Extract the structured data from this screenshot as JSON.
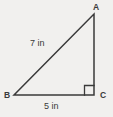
{
  "figure": {
    "type": "right-triangle-diagram",
    "vertices": {
      "a": "A",
      "b": "B",
      "c": "C"
    },
    "side_labels": {
      "hypotenuse_ab": "7 in",
      "base_bc": "5 in"
    },
    "right_angle_at": "C",
    "colors": {
      "line": "#3a3a3a",
      "text": "#3a3a3a",
      "background": "#f1f0ee"
    }
  }
}
